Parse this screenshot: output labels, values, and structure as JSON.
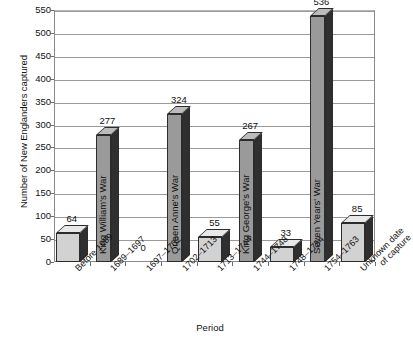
{
  "chart_data": {
    "type": "bar",
    "title": "",
    "xlabel": "Period",
    "ylabel": "Number of New Englanders captured",
    "ylim": [
      0,
      550
    ],
    "ytick_step": 50,
    "yticks": [
      0,
      50,
      100,
      150,
      200,
      250,
      300,
      350,
      400,
      450,
      500,
      550
    ],
    "grid": true,
    "legend": "none",
    "style": "3d-column",
    "categories": [
      "Before 1689",
      "1689–1697",
      "1697–1702",
      "1702–1713",
      "1713–1744",
      "1744–1748",
      "1748–1754",
      "1754–1763",
      "Unknown date of capture"
    ],
    "values": [
      64,
      277,
      0,
      324,
      55,
      267,
      33,
      536,
      85
    ],
    "bar_labels": [
      "64",
      "277",
      "0",
      "324",
      "55",
      "267",
      "33",
      "536",
      "85"
    ],
    "war_annotations": [
      {
        "index": 1,
        "label": "King William's War"
      },
      {
        "index": 3,
        "label": "Queen Anne's War"
      },
      {
        "index": 5,
        "label": "King George's War"
      },
      {
        "index": 7,
        "label": "Seven Years' War"
      }
    ]
  },
  "colors": {
    "bar_front_light": "#d2d2d2",
    "bar_front_dark": "#9a9a9a",
    "bar_side": "#2f2f2f",
    "bar_top_light": "#e8e8e8",
    "bar_top_dark": "#bcbcbc",
    "outline": "#2c2c2c",
    "gridline": "#9a9a9a",
    "axis": "#8a8a8a",
    "text": "#111111",
    "background": "#ffffff"
  },
  "x_label_lines": {
    "Unknown date of capture": [
      "Unknown date",
      "of capture"
    ]
  }
}
